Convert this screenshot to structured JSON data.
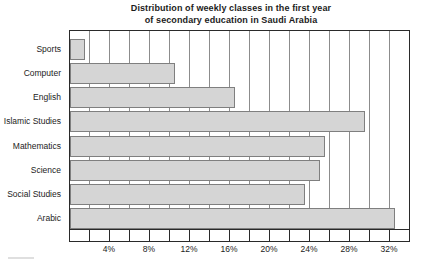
{
  "title": {
    "line1": "Distribution of weekly classes in the first year",
    "line2": "of secondary education in Saudi Arabia"
  },
  "chart_data": {
    "type": "bar",
    "orientation": "horizontal",
    "title": "Distribution of weekly classes in the first year of secondary education in Saudi Arabia",
    "categories": [
      "Sports",
      "Computer",
      "English",
      "Islamic Studies",
      "Mathematics",
      "Science",
      "Social Studies",
      "Arabic"
    ],
    "values": [
      1.5,
      10.5,
      16.5,
      29.5,
      25.5,
      25,
      23.5,
      32.5
    ],
    "unit": "%",
    "xlabel": "",
    "ylabel": "",
    "xlim": [
      0,
      34
    ],
    "xtick_values": [
      4,
      8,
      12,
      16,
      20,
      24,
      28,
      32
    ],
    "xtick_labels": [
      "4%",
      "8%",
      "12%",
      "16%",
      "20%",
      "24%",
      "28%",
      "32%"
    ],
    "minor_tick_step": 2,
    "grid": "vertical",
    "gridline_step": 2,
    "legend": "none",
    "colors": {
      "bar_fill": "#d5d5d5",
      "bar_border": "#7f7f7f",
      "gridline": "#8c8c8c",
      "axis": "#2a2a2a",
      "text": "#1c1c1c",
      "background": "#ffffff"
    }
  }
}
